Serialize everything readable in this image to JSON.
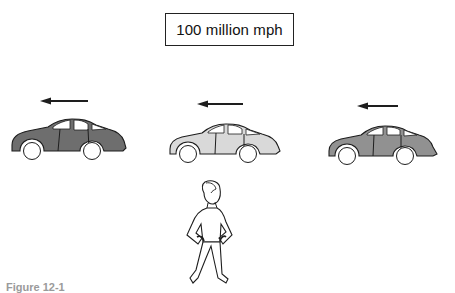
{
  "diagram": {
    "speed_label": "100 million mph",
    "caption": "Figure 12-1",
    "cars": [
      {
        "id": "left",
        "body_color": "#6e6e6e",
        "direction": "left"
      },
      {
        "id": "middle",
        "body_color": "#d9d9d9",
        "direction": "left"
      },
      {
        "id": "right",
        "body_color": "#919191",
        "direction": "left"
      }
    ],
    "observer": {
      "description": "stationary person with hands on hips"
    },
    "colors": {
      "stroke": "#1e1e1e",
      "background": "#ffffff",
      "wheel": "#ffffff"
    }
  }
}
